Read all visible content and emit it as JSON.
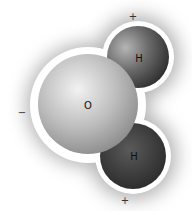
{
  "molecule": {
    "name": "water",
    "atoms": [
      {
        "id": "oxygen",
        "label": "O"
      },
      {
        "id": "hydrogen-top",
        "label": "H"
      },
      {
        "id": "hydrogen-bottom",
        "label": "H"
      }
    ],
    "charges": {
      "top_hydrogen": "+",
      "bottom_hydrogen": "+",
      "oxygen": "−"
    }
  }
}
